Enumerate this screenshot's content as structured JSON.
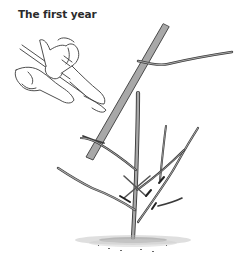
{
  "figure": {
    "title": "The first year",
    "colors": {
      "branch_fill": "#a8a8a8",
      "outline": "#3a3a3a",
      "background": "#ffffff"
    }
  }
}
